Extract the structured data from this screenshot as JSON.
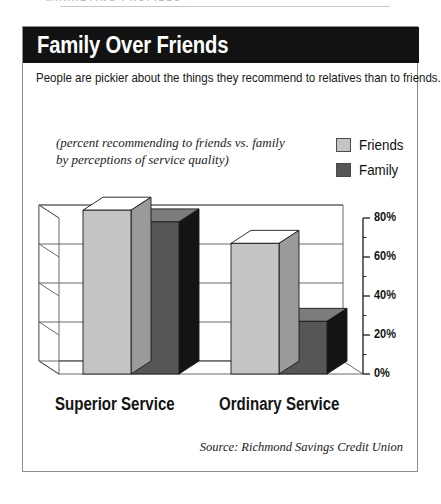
{
  "running_head": {
    "text": "MARKETING PROFILES"
  },
  "figure": {
    "title": "Family Over Friends",
    "intro": "People are pickier about the things they recommend to relatives than to friends.",
    "caption_line1": "(percent recommending to friends vs. family",
    "caption_line2": "by perceptions of service quality)",
    "source": "Source: Richmond Savings Credit Union"
  },
  "legend": {
    "items": [
      {
        "label": "Friends",
        "color": "#c4c4c4"
      },
      {
        "label": "Family",
        "color": "#565656"
      }
    ]
  },
  "colors": {
    "title_bar": "#121212",
    "border": "#8e8e8e",
    "friends_front": "#c4c4c4",
    "friends_top": "#ffffff",
    "friends_side": "#9a9a9a",
    "family_front": "#565656",
    "family_top": "#7c7c7c",
    "family_side": "#141414",
    "grid": "#5a5a5a",
    "axis": "#2b2b2b"
  },
  "chart_data": {
    "type": "bar",
    "title": "Family Over Friends",
    "subtitle": "(percent recommending to friends vs. family by perceptions of service quality)",
    "xlabel": "",
    "ylabel": "",
    "categories": [
      "Superior Service",
      "Ordinary Service"
    ],
    "series": [
      {
        "name": "Friends",
        "values": [
          84,
          67
        ]
      },
      {
        "name": "Family",
        "values": [
          78,
          27
        ]
      }
    ],
    "ylim": [
      0,
      80
    ],
    "ytick_values": [
      0,
      20,
      40,
      60,
      80
    ],
    "ytick_labels": [
      "0%",
      "20%",
      "40%",
      "60%",
      "80%"
    ],
    "minor_ticks": [
      10,
      30,
      50,
      70
    ],
    "grid": true,
    "three_d": true,
    "legend_position": "top-right",
    "source": "Source: Richmond Savings Credit Union"
  }
}
